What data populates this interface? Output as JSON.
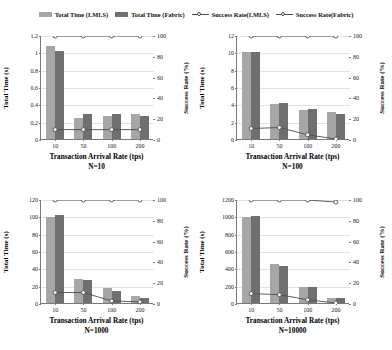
{
  "legend": {
    "entries": [
      {
        "label": "Total Time (LMLS)",
        "marker": "bar-swatch",
        "color": "#a6a6a6"
      },
      {
        "label": "Total Time (Fabric)",
        "marker": "bar-swatch",
        "color": "#6f6f6f"
      },
      {
        "label": "Success Rate(LMLS)",
        "marker": "line-marker",
        "color": "#4d4d4d"
      },
      {
        "label": "Success Rate(Fabric)",
        "marker": "line-marker",
        "color": "#4d4d4d"
      }
    ]
  },
  "axis_titles": {
    "y_left": "Total Time (s)",
    "y_right": "Success Rate (%)",
    "x": "Transaction  Arrival  Rate (tps)"
  },
  "chart_data": [
    {
      "type": "bar",
      "title": "N=10",
      "xlabel": "Transaction  Arrival  Rate (tps)",
      "ylabel": "Total Time (s)",
      "y2label": "Success Rate (%)",
      "categories": [
        "10",
        "50",
        "100",
        "200"
      ],
      "ylim": [
        0,
        1.2
      ],
      "yticks": [
        "0",
        "0.2",
        "0.4",
        "0.6",
        "0.8",
        "1",
        "1.2"
      ],
      "ytickvals": [
        0,
        0.2,
        0.4,
        0.6,
        0.8,
        1,
        1.2
      ],
      "y2lim": [
        0,
        100
      ],
      "y2ticks": [
        "0",
        "20",
        "40",
        "60",
        "80",
        "100"
      ],
      "y2tickvals": [
        0,
        20,
        40,
        60,
        80,
        100
      ],
      "grid": true,
      "legend_position": "top",
      "series": [
        {
          "name": "Total Time (LMLS)",
          "kind": "bar",
          "axis": "left",
          "values": [
            1.07,
            0.245,
            0.27,
            0.285
          ]
        },
        {
          "name": "Total Time (Fabric)",
          "kind": "bar",
          "axis": "left",
          "values": [
            1.01,
            0.285,
            0.285,
            0.27
          ]
        },
        {
          "name": "Success Rate(LMLS)",
          "kind": "line",
          "axis": "right",
          "values": [
            100,
            100,
            100,
            100
          ]
        },
        {
          "name": "Success Rate(Fabric)",
          "kind": "line",
          "axis": "right",
          "values": [
            10,
            10,
            10,
            10
          ]
        }
      ]
    },
    {
      "type": "bar",
      "title": "N=100",
      "xlabel": "Transaction  Arrival  Rate (tps)",
      "ylabel": "Total Time (s)",
      "y2label": "Success Rate (%)",
      "categories": [
        "10",
        "50",
        "100",
        "200"
      ],
      "ylim": [
        0,
        12
      ],
      "yticks": [
        "0",
        "2",
        "4",
        "6",
        "8",
        "10",
        "12"
      ],
      "ytickvals": [
        0,
        2,
        4,
        6,
        8,
        10,
        12
      ],
      "y2lim": [
        0,
        100
      ],
      "y2ticks": [
        "0",
        "20",
        "40",
        "60",
        "80",
        "100"
      ],
      "y2tickvals": [
        0,
        20,
        40,
        60,
        80,
        100
      ],
      "grid": true,
      "legend_position": "top",
      "series": [
        {
          "name": "Total Time (LMLS)",
          "kind": "bar",
          "axis": "left",
          "values": [
            10.05,
            4.05,
            3.3,
            3.1
          ]
        },
        {
          "name": "Total Time (Fabric)",
          "kind": "bar",
          "axis": "left",
          "values": [
            10.05,
            4.2,
            3.5,
            2.9
          ]
        },
        {
          "name": "Success Rate(LMLS)",
          "kind": "line",
          "axis": "right",
          "values": [
            100,
            100,
            100,
            100
          ]
        },
        {
          "name": "Success Rate(Fabric)",
          "kind": "line",
          "axis": "right",
          "values": [
            11,
            12,
            5,
            1
          ]
        }
      ]
    },
    {
      "type": "bar",
      "title": "N=1000",
      "xlabel": "Transaction  Arrival  Rate (tps)",
      "ylabel": "Total Time (s)",
      "y2label": "Success Rate (%)",
      "categories": [
        "10",
        "50",
        "100",
        "200"
      ],
      "ylim": [
        0,
        120
      ],
      "yticks": [
        "0",
        "20",
        "40",
        "60",
        "80",
        "100",
        "120"
      ],
      "ytickvals": [
        0,
        20,
        40,
        60,
        80,
        100,
        120
      ],
      "y2lim": [
        0,
        100
      ],
      "y2ticks": [
        "0",
        "20",
        "40",
        "60",
        "80",
        "100"
      ],
      "y2tickvals": [
        0,
        20,
        40,
        60,
        80,
        100
      ],
      "grid": true,
      "legend_position": "top",
      "series": [
        {
          "name": "Total Time (LMLS)",
          "kind": "bar",
          "axis": "left",
          "values": [
            99,
            28,
            17,
            8
          ]
        },
        {
          "name": "Total Time (Fabric)",
          "kind": "bar",
          "axis": "left",
          "values": [
            102,
            27,
            14,
            6
          ]
        },
        {
          "name": "Success Rate(LMLS)",
          "kind": "line",
          "axis": "right",
          "values": [
            100,
            100,
            100,
            100
          ]
        },
        {
          "name": "Success Rate(Fabric)",
          "kind": "line",
          "axis": "right",
          "values": [
            11,
            11,
            3,
            2
          ]
        }
      ]
    },
    {
      "type": "bar",
      "title": "N=10000",
      "xlabel": "Transaction  Arrival  Rate (tps)",
      "ylabel": "Total Time (s)",
      "y2label": "Success Rate (%)",
      "categories": [
        "10",
        "50",
        "100",
        "200"
      ],
      "ylim": [
        0,
        1200
      ],
      "yticks": [
        "0",
        "200",
        "400",
        "600",
        "800",
        "1000",
        "1200"
      ],
      "ytickvals": [
        0,
        200,
        400,
        600,
        800,
        1000,
        1200
      ],
      "y2lim": [
        0,
        100
      ],
      "y2ticks": [
        "0",
        "20",
        "40",
        "60",
        "80",
        "100"
      ],
      "y2tickvals": [
        0,
        20,
        40,
        60,
        80,
        100
      ],
      "grid": true,
      "legend_position": "top",
      "series": [
        {
          "name": "Total Time (LMLS)",
          "kind": "bar",
          "axis": "left",
          "values": [
            995,
            450,
            180,
            55
          ]
        },
        {
          "name": "Total Time (Fabric)",
          "kind": "bar",
          "axis": "left",
          "values": [
            1000,
            425,
            180,
            55
          ]
        },
        {
          "name": "Success Rate(LMLS)",
          "kind": "line",
          "axis": "right",
          "values": [
            100,
            100,
            100,
            98
          ]
        },
        {
          "name": "Success Rate(Fabric)",
          "kind": "line",
          "axis": "right",
          "values": [
            10,
            9,
            4,
            1
          ]
        }
      ]
    }
  ]
}
